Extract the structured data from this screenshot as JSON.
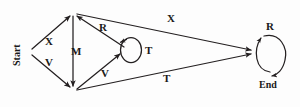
{
  "diagram": {
    "type": "directed-graph",
    "stroke_color": "#231f20",
    "background_color": "#fdfdfd",
    "nodes": [
      {
        "id": "start",
        "label": "Start",
        "x": 30,
        "y": 52,
        "orientation": "vertical-bottom-up"
      },
      {
        "id": "top",
        "label": "",
        "x": 73,
        "y": 13,
        "orientation": "none"
      },
      {
        "id": "bottom",
        "label": "",
        "x": 73,
        "y": 90,
        "orientation": "none"
      },
      {
        "id": "middle",
        "label": "",
        "x": 127,
        "y": 50,
        "orientation": "none"
      },
      {
        "id": "end",
        "label": "End",
        "x": 270,
        "y": 52,
        "orientation": "horizontal"
      }
    ],
    "edges": [
      {
        "id": "e1",
        "label": "X",
        "from": "start",
        "to": "top",
        "label_x": 45,
        "label_y": 36
      },
      {
        "id": "e2",
        "label": "V",
        "from": "start",
        "to": "bottom",
        "label_x": 45,
        "label_y": 57
      },
      {
        "id": "e3",
        "label": "M",
        "from": "top",
        "to": "bottom",
        "label_x": 71,
        "label_y": 46
      },
      {
        "id": "e4",
        "label": "R",
        "from": "middle",
        "to": "top",
        "label_x": 99,
        "label_y": 22
      },
      {
        "id": "e5",
        "label": "V",
        "from": "bottom",
        "to": "middle",
        "label_x": 101,
        "label_y": 68
      },
      {
        "id": "e6",
        "label": "T",
        "from": "middle",
        "to": "middle",
        "label_x": 145,
        "label_y": 45,
        "self_loop": true
      },
      {
        "id": "e7",
        "label": "X",
        "from": "top",
        "to": "end",
        "label_x": 167,
        "label_y": 13
      },
      {
        "id": "e8",
        "label": "T",
        "from": "bottom",
        "to": "end",
        "label_x": 163,
        "label_y": 73
      },
      {
        "id": "e9",
        "label": "R",
        "from": "end",
        "to": "end",
        "label_x": 266,
        "label_y": 21,
        "self_loop": true
      }
    ]
  }
}
